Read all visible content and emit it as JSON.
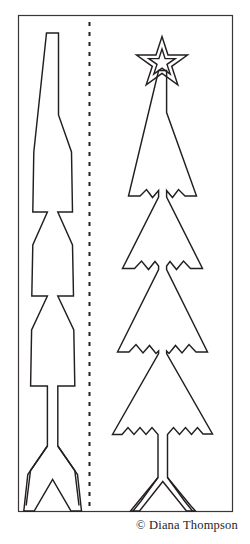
{
  "document": {
    "type": "papercraft-cutting-template",
    "title": "Christmas Tree Pop-Up Cutting Template",
    "background_color": "#ffffff",
    "line_color": "#231f20",
    "credit": "© Diana Thompson"
  },
  "frame": {
    "name": "border-rectangle",
    "x": 18,
    "y": 15,
    "width": 215,
    "height": 497,
    "stroke": "#3a3637",
    "stroke_width": 1.1
  },
  "fold_line": {
    "name": "dashed-fold-line",
    "x": 89.5,
    "y_start": 22,
    "y_end": 508,
    "stroke": "#2b2728",
    "stroke_width": 2,
    "dash": "4 6"
  },
  "left_tree": {
    "name": "plain-fir-tree",
    "description": "Simple layered fir tree silhouette with straight tier edges, vertical trunk and splayed base feet",
    "tier_count": 4,
    "has_star": false,
    "has_snow_edges": false,
    "outline": "M 46.5,33 L 58.5,33 L 58.5,115 L 71.5,153 L 72.5,213 L 57.5,213 L 72.5,245 L 73.5,297 L 57.5,297 L 73.5,330 L 74.5,386 L 57.5,386 L 57.5,446 L 76.5,474 L 76.5,481 L 80.5,511 L 70.5,511 L 52.5,478 L 34.5,511 L 24.5,511 L 28.5,481 L 28.5,474 L 47.5,446 L 47.5,386 L 31.5,386 L 31.5,330 L 47.5,297 L 31.5,297 L 32.5,245 L 47.5,213 L 32.5,213 L 33.5,153 Z"
  },
  "right_tree": {
    "name": "snow-capped-fir-tree-with-star",
    "description": "Layered fir tree with jagged snow-edged tiers, five point star topper, trunk and splayed base feet",
    "tier_count": 4,
    "has_star": true,
    "has_snow_edges": true,
    "star": {
      "name": "star-topper",
      "points": 5,
      "outer_radius": 26,
      "inner_radius": 11,
      "center_x": 162,
      "center_y": 62,
      "double_outline": true,
      "inner_outline_scale": 0.52
    },
    "stem": {
      "x1": 158.5,
      "x2": 166.5,
      "y_top": 70,
      "y_bottom": 112
    },
    "outline": "M 158.5,70 L 166.5,70 L 166.5,112 L 196,196 L 185,196 L 178,190 L 172,197 L 166,191 L 160.5,197 L 166.5,197 L 202,268 L 190,268 L 183,261 L 176,269 L 169,261 L 161,269 L 166.5,269 L 207,352 L 196,352 L 189,345 L 182,353 L 175,345 L 167,353 L 166.5,353 L 212,434 L 203,434 L 197,428 L 191,434 L 185,428 L 179,434 L 173,428 L 167,434 L 167,477 L 190,504 L 190,511 L 196,511 L 173,483 L 151,511 L 145,511 L 158,477 L 158,434 L 152,434 L 146,428 L 140,434 L 134,428 L 128,434 L 122,428 L 116,434 L 158.5,353 L 158,353 L 150,345 L 143,353 L 136,345 L 129,352 L 118,352 L 158.5,269 L 158,269 L 150,261 L 143,269 L 136,261 L 129,268 L 117,268 L 158.5,197 L 159,197 L 153,191 L 147,197 L 141,190 L 134,196 L 123,196 Z"
  }
}
